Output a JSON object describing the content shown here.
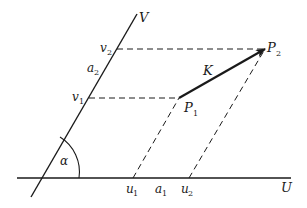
{
  "diagram": {
    "type": "oblique-coordinate-system",
    "colors": {
      "ink": "#1a1a1a",
      "background": "#ffffff"
    },
    "axes": {
      "u": {
        "label": "U"
      },
      "v": {
        "label": "V"
      }
    },
    "angle": {
      "label": "α"
    },
    "points": {
      "p1": {
        "label": "P",
        "sub": "1"
      },
      "p2": {
        "label": "P",
        "sub": "2"
      }
    },
    "vector": {
      "label": "K"
    },
    "ticks": {
      "u1": {
        "label": "u",
        "sub": "1"
      },
      "u2": {
        "label": "u",
        "sub": "2"
      },
      "v1": {
        "label": "v",
        "sub": "1"
      },
      "v2": {
        "label": "v",
        "sub": "2"
      }
    },
    "unit_vectors": {
      "a1": {
        "label": "a",
        "sub": "1"
      },
      "a2": {
        "label": "a",
        "sub": "2"
      }
    }
  }
}
